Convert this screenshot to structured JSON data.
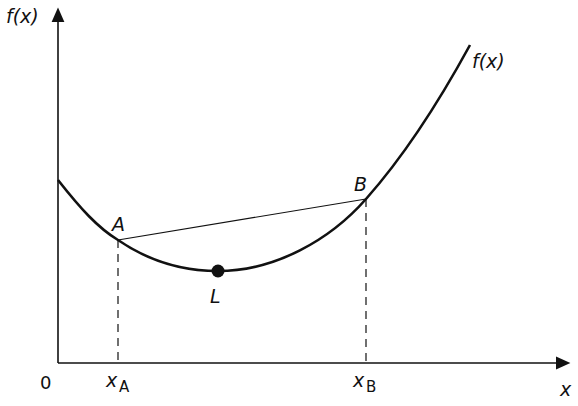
{
  "diagram": {
    "labels": {
      "y_axis": "f(x)",
      "x_axis": "x",
      "origin": "0",
      "curve": "f(x)",
      "point_a": "A",
      "point_b": "B",
      "point_l": "L",
      "x_a_main": "x",
      "x_a_sub": "A",
      "x_b_main": "x",
      "x_b_sub": "B"
    },
    "colors": {
      "ink": "#111111",
      "background": "#ffffff"
    }
  }
}
